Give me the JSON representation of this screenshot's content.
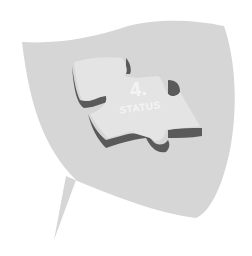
{
  "badge": {
    "number": "4.",
    "label": "STATUS",
    "icon": "puzzle-piece-icon",
    "colors": {
      "shield": "#d6d6d6",
      "piece_top": "#e4e4e4",
      "piece_side": "#5a5a5a",
      "text": "#f4f4f4"
    }
  }
}
